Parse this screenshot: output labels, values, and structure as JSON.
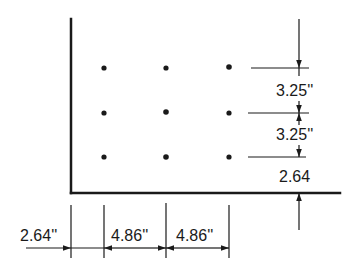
{
  "diagram": {
    "type": "dimension drawing",
    "colors": {
      "ink": "#1a1a1a",
      "background": "#ffffff"
    },
    "grid": {
      "rows": 3,
      "columns": 3
    },
    "vertical_dimensions": [
      {
        "label": "3.25''",
        "between": "top row to middle row"
      },
      {
        "label": "3.25''",
        "between": "middle row to bottom row"
      },
      {
        "label": "2.64",
        "between": "bottom row to bottom edge"
      }
    ],
    "horizontal_dimensions": [
      {
        "label": "2.64''",
        "between": "left edge to first column"
      },
      {
        "label": "4.86''",
        "between": "first column to second column"
      },
      {
        "label": "4.86''",
        "between": "second column to third column"
      }
    ]
  }
}
